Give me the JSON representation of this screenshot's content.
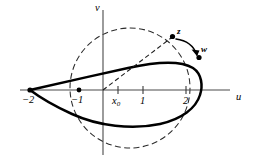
{
  "figure": {
    "background_color": "#ffffff",
    "curve_color": "#000000",
    "axis_color": "#4a4a4a",
    "dash_color": "#2b2b2b"
  },
  "axes": {
    "horizontal": {
      "name": "u-axis",
      "label": "u",
      "origin_px": 103,
      "y_px": 90,
      "unit_px": 24,
      "x_start_px": 20,
      "x_end_px": 230
    },
    "vertical": {
      "name": "v-axis",
      "label": "v",
      "x_px": 103,
      "y_start_px": 10,
      "y_end_px": 155
    }
  },
  "ticks": [
    {
      "label": "x",
      "subscript": "0",
      "value": 0.62,
      "x_px": 118,
      "show_tick": true,
      "label_x_px": 112,
      "label_y_px": 96
    },
    {
      "label": "1",
      "subscript": "",
      "value": 1,
      "x_px": 143,
      "show_tick": true,
      "label_x_px": 140,
      "label_y_px": 96
    },
    {
      "label": "2",
      "subscript": "",
      "value": 2,
      "x_px": 186,
      "show_tick": true,
      "label_x_px": 183,
      "label_y_px": 96
    }
  ],
  "marked_points": [
    {
      "name": "cusp-point",
      "label": "−2",
      "value": -2,
      "x_px": 30,
      "y_px": 90,
      "label_x_px": 22,
      "label_y_px": 95,
      "dot_radius": 2.6
    },
    {
      "name": "center-offset-point",
      "label": "−1",
      "value": -1,
      "x_px": 79,
      "y_px": 90,
      "label_x_px": 71,
      "label_y_px": 95,
      "dot_radius": 2.4
    }
  ],
  "plane_points": [
    {
      "name": "point-z",
      "label": "z",
      "x_px": 172.5,
      "y_px": 36.5,
      "label_x_px": 177,
      "label_y_px": 27,
      "dot_radius": 2.6
    },
    {
      "name": "point-w",
      "label": "w",
      "x_px": 199,
      "y_px": 57.5,
      "label_x_px": 201,
      "label_y_px": 45,
      "dot_radius": 2.6
    }
  ],
  "circle": {
    "name": "generating-circle",
    "center_x_px": 130,
    "center_y_px": 88,
    "radius_px": 60,
    "style": "dashed"
  },
  "ray": {
    "name": "radius-to-z",
    "from_x_px": 103,
    "from_y_px": 90,
    "to_x_px": 171,
    "to_y_px": 38,
    "style": "dashed"
  },
  "mapping_arrow": {
    "name": "z-to-w-arrow",
    "start_x_px": 176,
    "start_y_px": 39,
    "ctrl_x_px": 192,
    "ctrl_y_px": 41,
    "end_x_px": 197,
    "end_y_px": 55
  },
  "airfoil": {
    "name": "joukowski-airfoil",
    "cusp_x_px": 30,
    "cusp_y_px": 90,
    "upper_path": "M 30 90 C 60 83 96 75 128 68 C 155 62 180 60 193 68 C 202 74 203 86 200 95 C 196 108 182 119 160 124 C 132 130 98 126 72 114 C 52 105 38 96 30 90 Z",
    "right_tip_x_px": 202
  }
}
